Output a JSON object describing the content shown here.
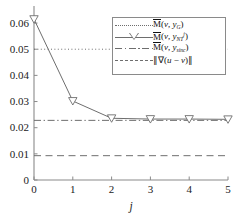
{
  "chart_data": {
    "type": "line",
    "title": "",
    "xlabel": "j",
    "ylabel": "",
    "xlim": [
      0,
      5
    ],
    "ylim": [
      0,
      0.065
    ],
    "grid": false,
    "legend_position": "upper-right",
    "xticks": [
      "0",
      "1",
      "2",
      "3",
      "4",
      "5"
    ],
    "xtick_values": [
      0,
      1,
      2,
      3,
      4,
      5
    ],
    "yticks": [
      "0",
      "0.01",
      "0.02",
      "0.03",
      "0.04",
      "0.05",
      "0.06"
    ],
    "ytick_values": [
      0,
      0.01,
      0.02,
      0.03,
      0.04,
      0.05,
      0.06
    ],
    "x": [
      0,
      1,
      2,
      3,
      4,
      5
    ],
    "series": [
      {
        "name": "M_bar(v, y_G)",
        "style": "dotted",
        "marker": "none",
        "kind": "horizontal-reference",
        "value": 0.05,
        "color": "#6e6e6e"
      },
      {
        "name": "M_bar(v, y_NT^j)",
        "style": "solid",
        "marker": "triangle-down",
        "kind": "data",
        "values": [
          0.0615,
          0.0302,
          0.0236,
          0.0233,
          0.0233,
          0.0232
        ],
        "color": "#6e6e6e"
      },
      {
        "name": "M_bar(v, y_sinc)",
        "style": "dashdot",
        "marker": "none",
        "kind": "horizontal-reference",
        "value": 0.0228,
        "color": "#6e6e6e"
      },
      {
        "name": "||grad(u - v)||",
        "style": "dashed",
        "marker": "none",
        "kind": "horizontal-reference",
        "value": 0.0093,
        "color": "#6e6e6e"
      }
    ]
  },
  "axes": {
    "x_title": "j",
    "y_tick_labels": [
      "0.06",
      "0.05",
      "0.04",
      "0.03",
      "0.02",
      "0.01",
      "0"
    ],
    "x_tick_labels": [
      "0",
      "1",
      "2",
      "3",
      "4",
      "5"
    ]
  },
  "legend": {
    "entries": [
      {
        "line_style": "dotted",
        "has_marker": false,
        "label_html": "<span class=\"mbar\">M</span>(<span class=\"it\">v</span>, <span class=\"it\">y</span><sub>G</sub>)"
      },
      {
        "line_style": "solid",
        "has_marker": true,
        "label_html": "<span class=\"mbar\">M</span>(<span class=\"it\">v</span>, <span class=\"it\">y</span><sub>NT</sub><sup>j</sup>)"
      },
      {
        "line_style": "dashdot",
        "has_marker": false,
        "label_html": "<span class=\"mbar\">M</span>(<span class=\"it\">v</span>, <span class=\"it\">y</span><sub>sinc</sub>)"
      },
      {
        "line_style": "dashed",
        "has_marker": false,
        "label_html": "&#8741;&#8711;(<span class=\"it\">u</span> &#8722; <span class=\"it\">v</span>)&#8741;"
      }
    ]
  },
  "colors": {
    "line": "#6e6e6e",
    "axis": "#8a8a8a",
    "text": "#1a1a1a",
    "background": "#ffffff",
    "marker_face": "#ffffff"
  }
}
